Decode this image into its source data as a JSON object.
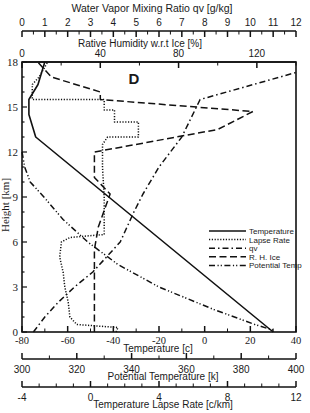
{
  "chart_data": {
    "type": "line",
    "title": "",
    "panel_label": "D",
    "ylabel": "Height [km]",
    "ylim": [
      0,
      18
    ],
    "yticks": [
      0,
      3,
      6,
      9,
      12,
      15,
      18
    ],
    "axes": {
      "top_outer": {
        "label": "Water Vapor Mixing Ratio qv [g/kg]",
        "range": [
          0,
          12
        ],
        "ticks": [
          0,
          1,
          2,
          3,
          4,
          5,
          6,
          7,
          8,
          9,
          10,
          11,
          12
        ]
      },
      "top_inner": {
        "label": "Rative Humidity w.r.t Ice [%]",
        "range": [
          0,
          140
        ],
        "ticks": [
          0,
          40,
          80,
          120
        ]
      },
      "bottom_1": {
        "label": "Temperature [c]",
        "range": [
          -80,
          40
        ],
        "ticks": [
          -80,
          -60,
          -40,
          -20,
          0,
          20,
          40
        ]
      },
      "bottom_2": {
        "label": "Potential Temperature [k]",
        "range": [
          300,
          400
        ],
        "ticks": [
          300,
          320,
          340,
          360,
          380,
          400
        ]
      },
      "bottom_3": {
        "label": "Temperature Lapse Rate [c/km]",
        "range": [
          -4,
          12
        ],
        "ticks": [
          -4,
          0,
          4,
          8,
          12
        ]
      }
    },
    "legend": {
      "position": "right-middle",
      "entries": [
        "Temperature",
        "Lapse Rate",
        "qv",
        "R. H. Ice",
        "Potential Temp"
      ]
    },
    "series": [
      {
        "name": "Temperature",
        "axis": "bottom_1",
        "style": "solid",
        "points": [
          [
            30,
            0
          ],
          [
            22,
            1
          ],
          [
            10,
            2.5
          ],
          [
            -2,
            4
          ],
          [
            -14,
            5.5
          ],
          [
            -26,
            7
          ],
          [
            -38,
            8.5
          ],
          [
            -50,
            10
          ],
          [
            -62,
            11.5
          ],
          [
            -74,
            13
          ],
          [
            -77,
            14.5
          ],
          [
            -77,
            15.5
          ],
          [
            -73,
            16.5
          ],
          [
            -70,
            18
          ]
        ]
      },
      {
        "name": "Lapse Rate",
        "axis": "bottom_3",
        "style": "dotted",
        "points": [
          [
            1.5,
            0
          ],
          [
            1.6,
            0.3
          ],
          [
            -0.8,
            0.5
          ],
          [
            -1.2,
            1
          ],
          [
            -1.3,
            2
          ],
          [
            -1.5,
            3
          ],
          [
            -1.6,
            4
          ],
          [
            -1.8,
            5
          ],
          [
            -1.7,
            6
          ],
          [
            -1.2,
            6.3
          ],
          [
            0.8,
            6.5
          ],
          [
            0.8,
            9
          ],
          [
            0.7,
            11
          ],
          [
            0.7,
            12.5
          ],
          [
            1.0,
            13
          ],
          [
            2.8,
            13
          ],
          [
            2.8,
            14
          ],
          [
            1.4,
            14
          ],
          [
            1.4,
            14.8
          ],
          [
            0.8,
            14.8
          ],
          [
            0.8,
            15.5
          ],
          [
            -3.2,
            15.5
          ],
          [
            -3.4,
            15.5
          ],
          [
            -3.4,
            16.5
          ],
          [
            -3.0,
            17
          ],
          [
            -2.5,
            18
          ]
        ]
      },
      {
        "name": "qv",
        "axis": "top_outer",
        "style": "dash-dot",
        "points": [
          [
            0.5,
            0
          ],
          [
            1.0,
            1
          ],
          [
            1.6,
            2
          ],
          [
            2.3,
            3
          ],
          [
            3.1,
            4
          ],
          [
            3.7,
            5
          ],
          [
            4.3,
            6
          ],
          [
            4.9,
            8
          ],
          [
            5.3,
            9.2
          ],
          [
            6.0,
            11
          ],
          [
            7.0,
            13
          ],
          [
            7.8,
            15.5
          ],
          [
            12,
            17.3
          ]
        ]
      },
      {
        "name": "R. H. Ice",
        "axis": "top_inner",
        "style": "dashed",
        "points": [
          [
            37,
            0
          ],
          [
            37,
            2
          ],
          [
            37,
            4
          ],
          [
            37,
            5.5
          ],
          [
            39,
            7
          ],
          [
            45,
            9.2
          ],
          [
            37,
            10.3
          ],
          [
            37,
            12
          ],
          [
            100,
            13.5
          ],
          [
            118,
            14.7
          ],
          [
            40,
            15.5
          ],
          [
            40,
            16
          ],
          [
            15,
            17
          ],
          [
            8,
            18
          ]
        ]
      },
      {
        "name": "Potential Temp",
        "axis": "bottom_2",
        "style": "dash-dot-dot",
        "points": [
          [
            300,
            12
          ],
          [
            301,
            11
          ],
          [
            303,
            10
          ],
          [
            308,
            9
          ],
          [
            315,
            7.5
          ],
          [
            324,
            6
          ],
          [
            335,
            4.5
          ],
          [
            350,
            3
          ],
          [
            370,
            1.5
          ],
          [
            385,
            0.5
          ],
          [
            392,
            0.1
          ]
        ]
      }
    ]
  },
  "labels": {
    "top_outer_axis": "Water Vapor Mixing Ratio qv [g/kg]",
    "top_inner_axis": "Rative Humidity w.r.t Ice [%]",
    "y_axis": "Height [km]",
    "temp_axis": "Temperature [c]",
    "ptemp_axis": "Potential Temperature [k]",
    "lapse_axis": "Temperature Lapse Rate [c/km]",
    "panel": "D"
  }
}
